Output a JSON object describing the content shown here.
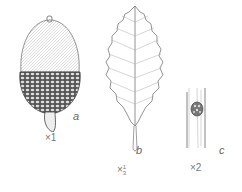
{
  "figures": [
    {
      "id": "a",
      "subject": "acorn",
      "label": "a",
      "scale": "×1"
    },
    {
      "id": "b",
      "subject": "leaf",
      "label": "b",
      "scale_prefix": "×",
      "scale_num": "1",
      "scale_den": "3"
    },
    {
      "id": "c",
      "subject": "bud on twig",
      "label": "c",
      "scale": "×2"
    }
  ]
}
